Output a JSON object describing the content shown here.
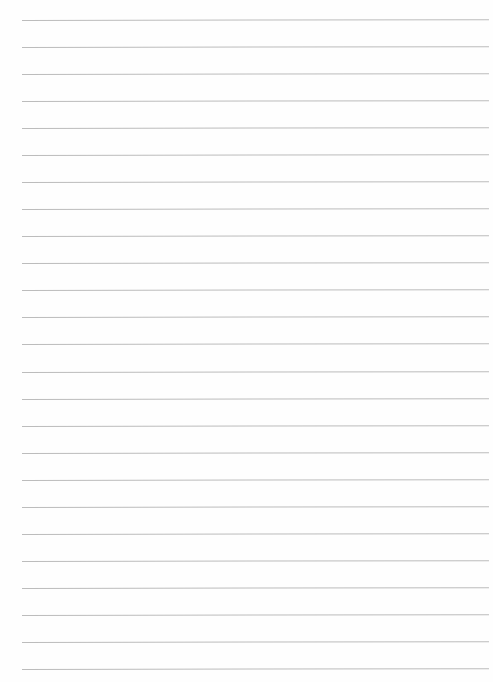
{
  "page": {
    "type": "lined-paper",
    "background": "#fefefe",
    "rule_color": "#bcbcbc",
    "rule_count": 25,
    "first_rule_y": 20,
    "rule_spacing": 27.04,
    "rule_left": 22,
    "rule_right": 489
  }
}
